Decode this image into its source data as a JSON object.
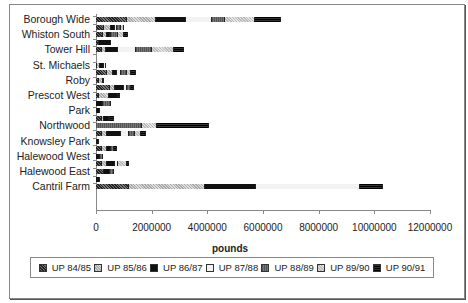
{
  "chart_data": {
    "type": "bar",
    "orientation": "horizontal",
    "stacked": true,
    "title": "",
    "xlabel": "pounds",
    "ylabel": "",
    "xlim": [
      0,
      12000000
    ],
    "xticks": [
      "0",
      "2000000",
      "4000000",
      "6000000",
      "8000000",
      "10000000",
      "12000000"
    ],
    "grid": false,
    "legend_position": "bottom",
    "series_names": [
      "UP 84/85",
      "UP 85/86",
      "UP 86/87",
      "UP 87/88",
      "UP 88/89",
      "UP 89/90",
      "UP 90/91"
    ],
    "rows": [
      {
        "label": "Borough Wide",
        "values": [
          1100000,
          1050000,
          1070000,
          950000,
          450000,
          1100000,
          920000
        ]
      },
      {
        "label": "",
        "values": [
          300000,
          250000,
          150000,
          50000,
          150000,
          100000,
          0
        ]
      },
      {
        "label": "Whiston South",
        "values": [
          250000,
          150000,
          100000,
          50000,
          250000,
          200000,
          150000
        ]
      },
      {
        "label": "",
        "values": [
          100000,
          0,
          450000,
          0,
          0,
          0,
          0
        ]
      },
      {
        "label": "Tower Hill",
        "values": [
          200000,
          150000,
          450000,
          650000,
          550000,
          800000,
          350000
        ]
      },
      {
        "label": "",
        "values": [
          0,
          0,
          0,
          0,
          0,
          0,
          0
        ]
      },
      {
        "label": "St. Michaels",
        "values": [
          50000,
          100000,
          150000,
          50000,
          0,
          0,
          0
        ]
      },
      {
        "label": "",
        "values": [
          400000,
          200000,
          150000,
          150000,
          200000,
          150000,
          200000
        ]
      },
      {
        "label": "Roby",
        "values": [
          100000,
          150000,
          50000,
          0,
          0,
          0,
          0
        ]
      },
      {
        "label": "",
        "values": [
          500000,
          200000,
          300000,
          100000,
          150000,
          0,
          100000
        ]
      },
      {
        "label": "Prescot West",
        "values": [
          100000,
          350000,
          350000,
          0,
          0,
          0,
          50000
        ]
      },
      {
        "label": "",
        "values": [
          0,
          0,
          250000,
          0,
          300000,
          0,
          0
        ]
      },
      {
        "label": "Park",
        "values": [
          50000,
          0,
          100000,
          0,
          0,
          0,
          0
        ]
      },
      {
        "label": "",
        "values": [
          200000,
          100000,
          150000,
          0,
          50000,
          0,
          150000
        ]
      },
      {
        "label": "Northwood",
        "values": [
          0,
          0,
          0,
          0,
          1650000,
          550000,
          1850000
        ]
      },
      {
        "label": "",
        "values": [
          200000,
          200000,
          500000,
          300000,
          200000,
          200000,
          200000
        ]
      },
      {
        "label": "Knowsley Park",
        "values": [
          50000,
          0,
          50000,
          0,
          0,
          0,
          0
        ]
      },
      {
        "label": "",
        "values": [
          200000,
          200000,
          150000,
          0,
          100000,
          0,
          100000
        ]
      },
      {
        "label": "Halewood West",
        "values": [
          0,
          0,
          150000,
          0,
          100000,
          0,
          0
        ]
      },
      {
        "label": "",
        "values": [
          200000,
          200000,
          300000,
          100000,
          0,
          300000,
          100000
        ]
      },
      {
        "label": "Halewood East",
        "values": [
          300000,
          0,
          200000,
          0,
          150000,
          0,
          0
        ]
      },
      {
        "label": "",
        "values": [
          0,
          0,
          150000,
          0,
          0,
          0,
          0
        ]
      },
      {
        "label": "Cantril Farm",
        "values": [
          1200000,
          2700000,
          1850000,
          3750000,
          0,
          0,
          800000
        ]
      }
    ]
  },
  "labels": {
    "categories": [
      "Borough Wide",
      "Whiston South",
      "Tower Hill",
      "St. Michaels",
      "Roby",
      "Prescot West",
      "Park",
      "Northwood",
      "Knowsley Park",
      "Halewood West",
      "Halewood East",
      "Cantril Farm"
    ],
    "xticks": [
      "0",
      "2000000",
      "4000000",
      "6000000",
      "8000000",
      "10000000",
      "12000000"
    ],
    "xlabel": "pounds",
    "legend": [
      "UP 84/85",
      "UP 85/86",
      "UP 86/87",
      "UP 87/88",
      "UP 88/89",
      "UP 89/90",
      "UP 90/91"
    ]
  }
}
